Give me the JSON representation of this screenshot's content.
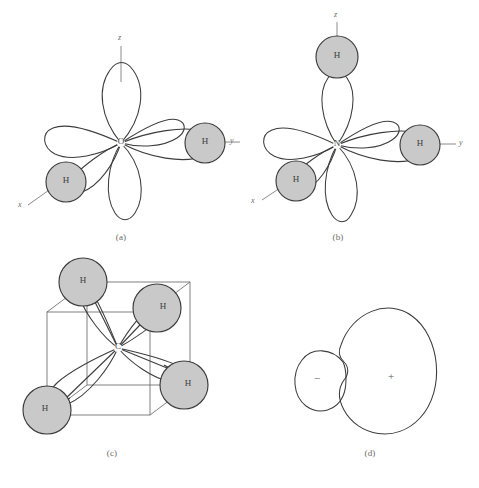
{
  "figure": {
    "background_color": "#ffffff",
    "line_color": "#3c3c3c",
    "atom_fill_color": "#c9c9c9",
    "axis_color": "#8a8a8a"
  },
  "panels": [
    {
      "id": "a",
      "caption": "(a)",
      "molecule": "water",
      "center_atom": "O",
      "hydrogen_count": 2,
      "hydrogen_labels": [
        "H",
        "H"
      ],
      "axes": [
        {
          "name": "z",
          "label": "z"
        },
        {
          "name": "y",
          "label": "y"
        },
        {
          "name": "x",
          "label": "x"
        }
      ]
    },
    {
      "id": "b",
      "caption": "(b)",
      "molecule": "ammonia",
      "center_atom": "N",
      "hydrogen_count": 3,
      "hydrogen_labels": [
        "H",
        "H",
        "H"
      ],
      "axes": [
        {
          "name": "z",
          "label": "z"
        },
        {
          "name": "y",
          "label": "y"
        },
        {
          "name": "x",
          "label": "x"
        }
      ]
    },
    {
      "id": "c",
      "caption": "(c)",
      "molecule": "methane",
      "center_atom": "C",
      "hydrogen_count": 4,
      "hydrogen_labels": [
        "H",
        "H",
        "H",
        "H"
      ],
      "axes": []
    },
    {
      "id": "d",
      "caption": "(d)",
      "molecule": "sp3 hybrid orbital",
      "center_atom": "",
      "hydrogen_count": 0,
      "hydrogen_labels": [],
      "lobe_signs": {
        "small": "−",
        "large": "+"
      },
      "axes": []
    }
  ],
  "labels": {
    "hydrogen": "H",
    "oxygen": "O",
    "nitrogen": "N",
    "carbon": "C",
    "minus_sign": "−",
    "plus_sign": "+",
    "axis_z": "z",
    "axis_y": "y",
    "axis_x": "x",
    "caption_a": "(a)",
    "caption_b": "(b)",
    "caption_c": "(c)",
    "caption_d": "(d)"
  }
}
